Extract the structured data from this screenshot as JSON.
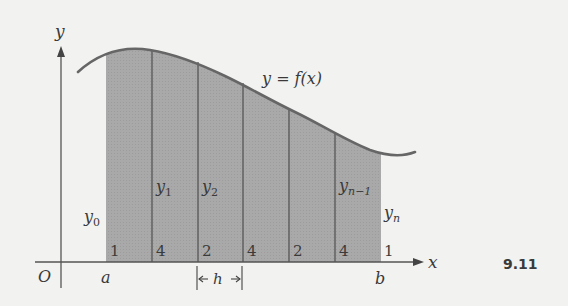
{
  "figure": {
    "number": "9.11",
    "colors": {
      "background": "#f2f2f0",
      "shade": "#a9a9a9",
      "line": "#555555",
      "curve": "#666666",
      "text": "#3a3a3a"
    }
  },
  "axes": {
    "x_label": "x",
    "y_label": "y",
    "origin_label": "O"
  },
  "curve": {
    "label": "y = f(x)"
  },
  "interval": {
    "start_label": "a",
    "end_label": "b",
    "width_label": "h"
  },
  "ordinates": [
    {
      "label": "y",
      "sub": "0"
    },
    {
      "label": "y",
      "sub": "1"
    },
    {
      "label": "y",
      "sub": "2"
    },
    {
      "label": "y",
      "sub": "n−1"
    },
    {
      "label": "y",
      "sub": "n"
    }
  ],
  "weights": [
    "1",
    "4",
    "2",
    "4",
    "2",
    "4",
    "1"
  ]
}
